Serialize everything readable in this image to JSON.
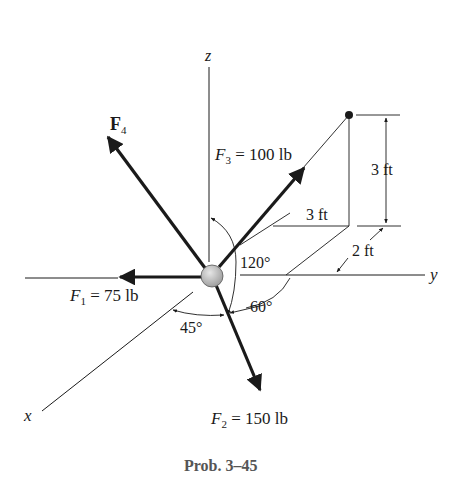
{
  "figure": {
    "caption": "Prob. 3–45",
    "axes": {
      "x": "x",
      "y": "y",
      "z": "z"
    },
    "forces": [
      {
        "id": "F1",
        "symbol": "F",
        "sub": "1",
        "eq": " = 75 lb",
        "bold": false
      },
      {
        "id": "F2",
        "symbol": "F",
        "sub": "2",
        "eq": " = 150 lb",
        "bold": false
      },
      {
        "id": "F3",
        "symbol": "F",
        "sub": "3",
        "eq": " = 100 lb",
        "bold": false
      },
      {
        "id": "F4",
        "symbol": "F",
        "sub": "4",
        "eq": "",
        "bold": true
      }
    ],
    "angles": {
      "a120": "120°",
      "a60": "60°",
      "a45": "45°"
    },
    "dimensions": {
      "height": "3 ft",
      "depth": "3 ft",
      "offset": "2 ft"
    },
    "colors": {
      "ink": "#1a1a1a",
      "particle_fill": "#bdbdbd",
      "caption": "#555555"
    }
  }
}
